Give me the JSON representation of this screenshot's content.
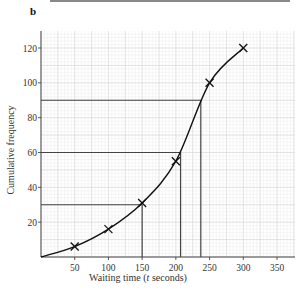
{
  "panel_label": "b",
  "chart_data": {
    "type": "line",
    "title": "",
    "xlabel": "Waiting time (t seconds)",
    "ylabel": "Cumulative frequency",
    "xlim": [
      0,
      375
    ],
    "ylim": [
      0,
      130
    ],
    "x_ticks": [
      50,
      100,
      150,
      200,
      250,
      300,
      350
    ],
    "y_ticks": [
      20,
      40,
      60,
      80,
      100,
      120
    ],
    "grid": true,
    "series": [
      {
        "name": "Cumulative frequency curve",
        "marker": "x",
        "x": [
          0,
          50,
          100,
          150,
          200,
          250,
          300
        ],
        "y": [
          0,
          6,
          16,
          31,
          55,
          100,
          120
        ]
      }
    ],
    "reading_lines": [
      {
        "y": 30,
        "x": 150
      },
      {
        "y": 60,
        "x": 207
      },
      {
        "y": 90,
        "x": 237
      }
    ]
  },
  "axes": {
    "x_tick_labels": [
      "50",
      "100",
      "150",
      "200",
      "250",
      "300",
      "350"
    ],
    "y_tick_labels": [
      "20",
      "40",
      "60",
      "80",
      "100",
      "120"
    ],
    "xlabel_main": "Waiting time (",
    "xlabel_var": "t",
    "xlabel_end": " seconds)",
    "ylabel": "Cumulative frequency"
  }
}
